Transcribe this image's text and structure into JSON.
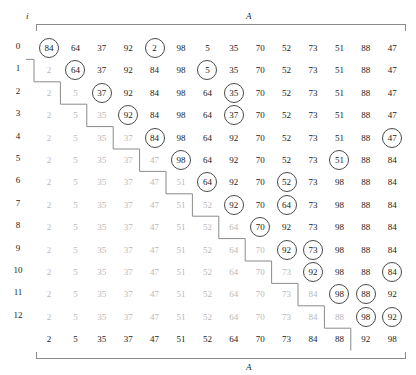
{
  "figure": {
    "type": "insertion-sort-trace-table",
    "axis_top_label": "A",
    "axis_bottom_label": "A",
    "row_axis_label": "i"
  },
  "chart_data": {
    "type": "table",
    "title": "",
    "xlabel": "A",
    "ylabel": "i",
    "row_labels": [
      "0",
      "1",
      "2",
      "3",
      "4",
      "5",
      "6",
      "7",
      "8",
      "9",
      "10",
      "11",
      "12",
      ""
    ],
    "column_count": 14,
    "rows": [
      {
        "i": "0",
        "values": [
          "84",
          "64",
          "37",
          "92",
          "2",
          "98",
          "5",
          "35",
          "70",
          "52",
          "73",
          "51",
          "88",
          "47"
        ],
        "dim_until": 0,
        "circled": [
          0,
          4
        ]
      },
      {
        "i": "1",
        "values": [
          "2",
          "64",
          "37",
          "92",
          "84",
          "98",
          "5",
          "35",
          "70",
          "52",
          "73",
          "51",
          "88",
          "47"
        ],
        "dim_until": 1,
        "circled": [
          1,
          6
        ]
      },
      {
        "i": "2",
        "values": [
          "2",
          "5",
          "37",
          "92",
          "84",
          "98",
          "64",
          "35",
          "70",
          "52",
          "73",
          "51",
          "88",
          "47"
        ],
        "dim_until": 2,
        "circled": [
          2,
          7
        ]
      },
      {
        "i": "3",
        "values": [
          "2",
          "5",
          "35",
          "92",
          "84",
          "98",
          "64",
          "37",
          "70",
          "52",
          "73",
          "51",
          "88",
          "47"
        ],
        "dim_until": 3,
        "circled": [
          3,
          7
        ]
      },
      {
        "i": "4",
        "values": [
          "2",
          "5",
          "35",
          "37",
          "84",
          "98",
          "64",
          "92",
          "70",
          "52",
          "73",
          "51",
          "88",
          "47"
        ],
        "dim_until": 4,
        "circled": [
          4,
          13
        ]
      },
      {
        "i": "5",
        "values": [
          "2",
          "5",
          "35",
          "37",
          "47",
          "98",
          "64",
          "92",
          "70",
          "52",
          "73",
          "51",
          "88",
          "84"
        ],
        "dim_until": 5,
        "circled": [
          5,
          11
        ]
      },
      {
        "i": "6",
        "values": [
          "2",
          "5",
          "35",
          "37",
          "47",
          "51",
          "64",
          "92",
          "70",
          "52",
          "73",
          "98",
          "88",
          "84"
        ],
        "dim_until": 6,
        "circled": [
          6,
          9
        ]
      },
      {
        "i": "7",
        "values": [
          "2",
          "5",
          "35",
          "37",
          "47",
          "51",
          "52",
          "92",
          "70",
          "64",
          "73",
          "98",
          "88",
          "84"
        ],
        "dim_until": 7,
        "circled": [
          7,
          9
        ]
      },
      {
        "i": "8",
        "values": [
          "2",
          "5",
          "35",
          "37",
          "47",
          "51",
          "52",
          "64",
          "70",
          "92",
          "73",
          "98",
          "88",
          "84"
        ],
        "dim_until": 8,
        "circled": [
          8
        ]
      },
      {
        "i": "9",
        "values": [
          "2",
          "5",
          "35",
          "37",
          "47",
          "51",
          "52",
          "64",
          "70",
          "92",
          "73",
          "98",
          "88",
          "84"
        ],
        "dim_until": 9,
        "circled": [
          9,
          10
        ]
      },
      {
        "i": "10",
        "values": [
          "2",
          "5",
          "35",
          "37",
          "47",
          "51",
          "52",
          "64",
          "70",
          "73",
          "92",
          "98",
          "88",
          "84"
        ],
        "dim_until": 10,
        "circled": [
          10,
          13
        ]
      },
      {
        "i": "11",
        "values": [
          "2",
          "5",
          "35",
          "37",
          "47",
          "51",
          "52",
          "64",
          "70",
          "73",
          "84",
          "98",
          "88",
          "92"
        ],
        "dim_until": 11,
        "circled": [
          11,
          12
        ]
      },
      {
        "i": "12",
        "values": [
          "2",
          "5",
          "35",
          "37",
          "47",
          "51",
          "52",
          "64",
          "70",
          "73",
          "84",
          "88",
          "98",
          "92"
        ],
        "dim_until": 12,
        "circled": [
          12,
          13
        ]
      },
      {
        "i": "",
        "values": [
          "2",
          "5",
          "35",
          "37",
          "47",
          "51",
          "52",
          "64",
          "70",
          "73",
          "84",
          "88",
          "92",
          "98"
        ],
        "dim_until": 0,
        "circled": []
      }
    ]
  },
  "colors": {
    "text": "#1a1a1a",
    "dim_text": "#b9b9b9",
    "circle_stroke": "#4a4a4a",
    "rule_stroke": "#8b8b8b",
    "staircase_stroke": "#8b8b8b",
    "background": "#ffffff"
  },
  "layout": {
    "col0_x": 36,
    "col_step": 26.4,
    "row0_y": 41,
    "row_step": 22.4
  }
}
